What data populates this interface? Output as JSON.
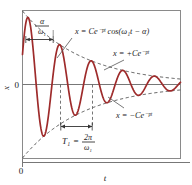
{
  "figure": {
    "title_visible": false,
    "axis": {
      "x_label": "t",
      "y_label": "x",
      "origin_label": "0",
      "zero_label": "0"
    },
    "annotations": {
      "phase_label_num": "α",
      "phase_label_den": "ω₁",
      "main_curve_eq": "x = Ce⁻ᵖᵗ cos(ω₁t − α)",
      "upper_envelope_eq": "x = +Ce⁻ᵖᵗ",
      "lower_envelope_eq": "x = −Ce⁻ᵖᵗ",
      "period_label": "T₁",
      "period_equals": "=",
      "period_num": "2π",
      "period_den": "ω₁"
    },
    "colors": {
      "curve": "#9e2b2b",
      "envelope": "#555555",
      "axis": "#777777",
      "frame": "#8a8a8a",
      "text": "#1a1a1a",
      "background": "#ffffff"
    }
  },
  "chart_data": {
    "type": "line",
    "xlabel": "t",
    "ylabel": "x",
    "grid": false,
    "legend": "inline-annotations",
    "xlim": [
      0,
      1
    ],
    "ylim": [
      -1.05,
      1.05
    ],
    "series": [
      {
        "name": "x = Ce^(-pt) cos(w1 t - alpha)",
        "role": "main-oscillation",
        "color": "#9e2b2b",
        "style": "solid",
        "model": {
          "function": "C*exp(-p*t)*cos(w1*t - alpha)",
          "C": 1.0,
          "p": 2.6,
          "w1": 31.4159,
          "alpha": 1.15
        }
      },
      {
        "name": "x = +Ce^(-pt)",
        "role": "upper-envelope",
        "color": "#555555",
        "style": "dashed",
        "model": {
          "function": "C*exp(-p*t)",
          "C": 1.0,
          "p": 2.6
        }
      },
      {
        "name": "x = -Ce^(-pt)",
        "role": "lower-envelope",
        "color": "#555555",
        "style": "dashed",
        "model": {
          "function": "-C*exp(-p*t)",
          "C": 1.0,
          "p": 2.6
        }
      }
    ],
    "markers": [
      {
        "name": "phase-shift-span",
        "label": "alpha / w1",
        "type": "horizontal-double-arrow",
        "from_x": 0.0,
        "to_x": 0.0366
      },
      {
        "name": "period-span",
        "label": "T1 = 2*pi / w1",
        "type": "horizontal-double-arrow",
        "from_x": 0.2366,
        "to_x": 0.4366
      }
    ]
  }
}
